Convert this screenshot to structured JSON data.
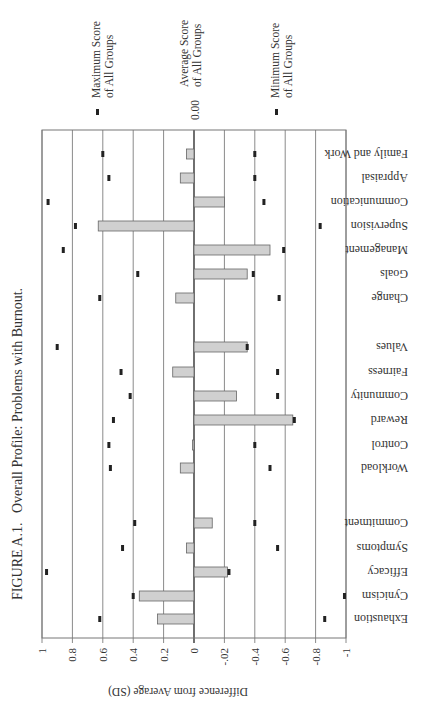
{
  "caption": {
    "figure_label": "FIGURE A.1.",
    "title": "Overall Profile: Problems with Burnout."
  },
  "legend": {
    "max": {
      "line1": "Maximum Score",
      "line2": "of All Groups"
    },
    "avg": {
      "line1": "Average Score",
      "line2": "of All Groups",
      "value": "0.00"
    },
    "min": {
      "line1": "Minimum Score",
      "line2": "of All Groups"
    }
  },
  "axis": {
    "label": "Difference from Average (SD)",
    "ticks": [
      "1",
      "0.8",
      "0.6",
      "0.4",
      "0.2",
      "0",
      "-.02",
      "-0.4",
      "-0.6",
      "-0.8",
      "-1"
    ]
  },
  "colors": {
    "bar_fill": "#d0d0d0",
    "bar_stroke": "#666666",
    "marker": "#222222",
    "grid": "#8a8a8a"
  },
  "chart_data": {
    "type": "bar",
    "orientation": "horizontal",
    "title": "FIGURE A.1. Overall Profile: Problems with Burnout.",
    "xlabel": "Difference from Average (SD)",
    "ylabel": "",
    "xlim": [
      1,
      -1
    ],
    "grid": true,
    "tick_labels": [
      "1",
      "0.8",
      "0.6",
      "0.4",
      "0.2",
      "0",
      "-.02",
      "-0.4",
      "-0.6",
      "-0.8",
      "-1"
    ],
    "legend": [
      "Maximum Score of All Groups",
      "Average Score of All Groups (0.00)",
      "Minimum Score of All Groups"
    ],
    "groups": [
      {
        "name": "Burnout",
        "categories": [
          "Exhaustion",
          "Cynicism",
          "Efficacy",
          "Symptoms",
          "Commitment"
        ]
      },
      {
        "name": "Areas of Worklife",
        "categories": [
          "Workload",
          "Control",
          "Reward",
          "Community",
          "Fairness",
          "Values"
        ]
      },
      {
        "name": "Organizational",
        "categories": [
          "Change",
          "Goals",
          "Management",
          "Supervision",
          "Communication",
          "Appraisal",
          "Family and Work"
        ]
      }
    ],
    "categories": [
      "Exhaustion",
      "Cynicism",
      "Efficacy",
      "Symptoms",
      "Commitment",
      "Workload",
      "Control",
      "Reward",
      "Community",
      "Fairness",
      "Values",
      "Change",
      "Goals",
      "Management",
      "Supervision",
      "Communication",
      "Appraisal",
      "Family and Work"
    ],
    "series": [
      {
        "name": "Profile Score",
        "kind": "bar",
        "values": [
          0.24,
          0.36,
          -0.22,
          0.05,
          -0.12,
          0.09,
          0.01,
          -0.65,
          -0.28,
          0.14,
          -0.35,
          0.12,
          -0.35,
          -0.5,
          0.63,
          -0.2,
          0.09,
          0.05
        ]
      },
      {
        "name": "Maximum Score of All Groups",
        "kind": "marker",
        "values": [
          0.62,
          0.4,
          0.97,
          0.47,
          0.39,
          0.55,
          0.56,
          0.53,
          0.42,
          0.48,
          0.9,
          0.62,
          0.37,
          0.86,
          0.78,
          0.96,
          0.56,
          0.6
        ]
      },
      {
        "name": "Minimum Score of All Groups",
        "kind": "marker",
        "values": [
          -0.86,
          -0.99,
          -0.23,
          -0.55,
          -0.4,
          -0.5,
          -0.4,
          -0.66,
          -0.55,
          -0.55,
          -0.35,
          -0.56,
          -0.39,
          -0.59,
          -0.83,
          -0.46,
          -0.4,
          -0.4
        ]
      }
    ],
    "category_positions": [
      619,
      596,
      572,
      548,
      523,
      468,
      445,
      420,
      396,
      372,
      347,
      298,
      274,
      250,
      226,
      202,
      178,
      154
    ]
  }
}
